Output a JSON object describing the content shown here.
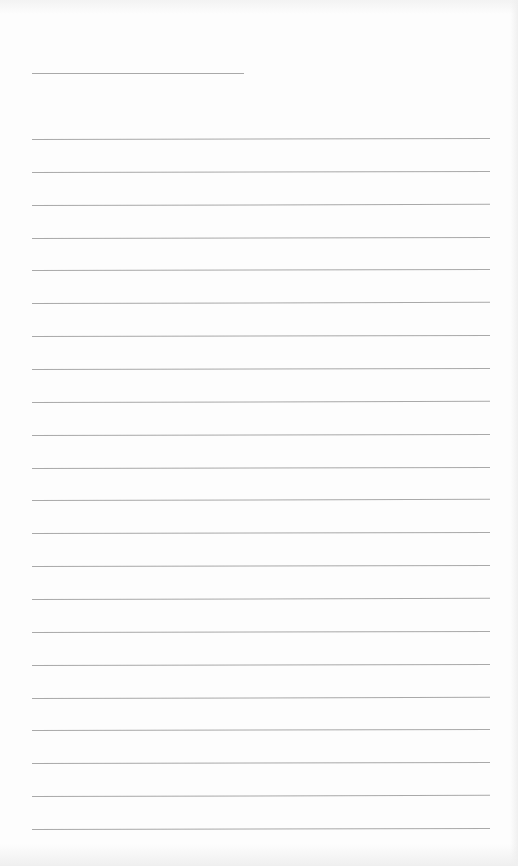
{
  "document": {
    "type": "blank-lined-page",
    "header_line": {
      "x": 32,
      "y": 73,
      "width": 212
    },
    "ruled_lines": {
      "count": 22,
      "start_y": 139,
      "spacing": 32.86,
      "x_start": 32,
      "x_end": 490
    },
    "colors": {
      "background": "#fdfdfd",
      "line": "#9a9a9a"
    }
  }
}
